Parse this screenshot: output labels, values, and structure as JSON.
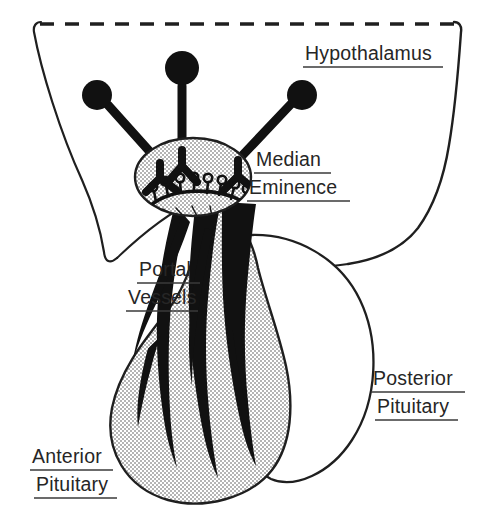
{
  "figure": {
    "type": "anatomical-line-diagram",
    "background_color": "#ffffff",
    "ink_color": "#1a1a1a",
    "stipple_fill_color": "#d8d8d8",
    "label_color": "#262626"
  },
  "labels": {
    "hypothalamus": {
      "text": "Hypothalamus",
      "underlined": true,
      "x": 305,
      "y": 60
    },
    "median_eminence": {
      "line1": "Median",
      "line2": "Eminence",
      "underlined": true,
      "x": 256,
      "y": 166
    },
    "portal_vessels": {
      "line1": "Portal",
      "line2": "Vessels",
      "underlined": true,
      "x": 136,
      "y": 276
    },
    "posterior_pituitary": {
      "line1": "Posterior",
      "line2": "Pituitary",
      "underlined": true,
      "x": 373,
      "y": 385
    },
    "anterior_pituitary": {
      "line1": "Anterior",
      "line2": "Pituitary",
      "underlined": true,
      "x": 30,
      "y": 463
    }
  },
  "structures": {
    "hypothalamus_boundary": {
      "name": "hypothalamus-outline",
      "top_edge": "dashed",
      "sides": "solid",
      "dash_pattern": "14 11"
    },
    "neurons": [
      {
        "name": "neuron-left",
        "soma_cx": 97,
        "soma_cy": 95,
        "soma_r": 15
      },
      {
        "name": "neuron-center",
        "soma_cx": 182,
        "soma_cy": 68,
        "soma_r": 17
      },
      {
        "name": "neuron-right",
        "soma_cx": 302,
        "soma_cy": 95,
        "soma_r": 15
      }
    ],
    "median_eminence": {
      "name": "median-eminence-body",
      "shape": "ellipse",
      "cx": 193,
      "cy": 177,
      "rx": 58,
      "ry": 39,
      "fill": "stipple",
      "capillary_loop_count": 8
    },
    "portal_vessels": {
      "name": "portal-vessel-bundle",
      "strand_count": 5,
      "fill": "solid-black",
      "description": "Long vessels running from median eminence down the stalk into the anterior lobe"
    },
    "anterior_pituitary": {
      "name": "anterior-pituitary-lobe",
      "fill": "stipple",
      "outline": "solid",
      "vessel_branch_count": 4
    },
    "posterior_pituitary": {
      "name": "posterior-pituitary-lobe",
      "fill": "none",
      "outline": "solid"
    }
  }
}
